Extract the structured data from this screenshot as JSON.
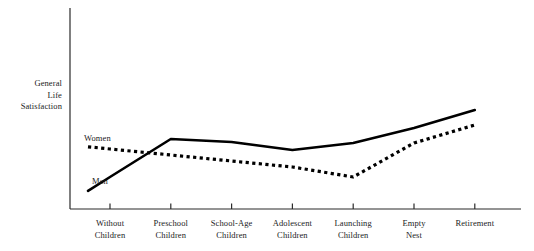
{
  "chart_data": {
    "type": "line",
    "title": "",
    "xlabel": "",
    "ylabel": "General Life Satisfaction",
    "ylabel_lines": [
      "General",
      "Life",
      "Satisfaction"
    ],
    "categories": [
      "Without Children",
      "Preschool Children",
      "School-Age Children",
      "Adolescent Children",
      "Launching Children",
      "Empty Nest",
      "Retirement"
    ],
    "category_lines": [
      [
        "Without",
        "Children"
      ],
      [
        "Preschool",
        "Children"
      ],
      [
        "School-Age",
        "Children"
      ],
      [
        "Adolescent",
        "Children"
      ],
      [
        "Launching",
        "Children"
      ],
      [
        "Empty",
        "Nest"
      ],
      [
        "Retirement"
      ]
    ],
    "series": [
      {
        "name": "Men",
        "style": "solid",
        "color": "#000000",
        "values": [
          18,
          56,
          53,
          45,
          52,
          67,
          85
        ],
        "label_text": "Men"
      },
      {
        "name": "Women",
        "style": "dotted",
        "color": "#000000",
        "values": [
          46,
          40,
          34,
          28,
          18,
          52,
          70
        ],
        "label_text": "Women"
      }
    ],
    "ylim": [
      0,
      100
    ],
    "y_axis_ticks": [],
    "grid": false,
    "legend_position": "inline-left",
    "axis_color": "#2b2b2b"
  }
}
